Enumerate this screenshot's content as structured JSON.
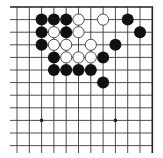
{
  "board": {
    "view": "top-right corner",
    "columns": 12,
    "rows": 12,
    "origin_x": 17,
    "origin_y": 7,
    "col_spacing": 12.3,
    "row_spacing": 12.6,
    "line_extend_left": 10,
    "line_extend_bottom": 153,
    "colors": {
      "line": "#3a3a3a",
      "border": "#222222",
      "black_stone": "#111111",
      "white_stone": "#ffffff",
      "white_stroke": "#222222",
      "background": "#ffffff"
    },
    "star_points": [
      {
        "col": 2,
        "row": 9
      },
      {
        "col": 8,
        "row": 9
      }
    ],
    "stones": [
      {
        "col": 2,
        "row": 1,
        "color": "black"
      },
      {
        "col": 3,
        "row": 1,
        "color": "black"
      },
      {
        "col": 4,
        "row": 1,
        "color": "black"
      },
      {
        "col": 5,
        "row": 1,
        "color": "white"
      },
      {
        "col": 7,
        "row": 1,
        "color": "white"
      },
      {
        "col": 9,
        "row": 1,
        "color": "black"
      },
      {
        "col": 2,
        "row": 2,
        "color": "black"
      },
      {
        "col": 3,
        "row": 2,
        "color": "white"
      },
      {
        "col": 4,
        "row": 2,
        "color": "black"
      },
      {
        "col": 5,
        "row": 2,
        "color": "white"
      },
      {
        "col": 10,
        "row": 2,
        "color": "black"
      },
      {
        "col": 2,
        "row": 3,
        "color": "black"
      },
      {
        "col": 3,
        "row": 3,
        "color": "white"
      },
      {
        "col": 4,
        "row": 3,
        "color": "white"
      },
      {
        "col": 6,
        "row": 3,
        "color": "white"
      },
      {
        "col": 8,
        "row": 3,
        "color": "black"
      },
      {
        "col": 3,
        "row": 4,
        "color": "black"
      },
      {
        "col": 4,
        "row": 4,
        "color": "white"
      },
      {
        "col": 5,
        "row": 4,
        "color": "white"
      },
      {
        "col": 6,
        "row": 4,
        "color": "white"
      },
      {
        "col": 7,
        "row": 4,
        "color": "black"
      },
      {
        "col": 3,
        "row": 5,
        "color": "black"
      },
      {
        "col": 4,
        "row": 5,
        "color": "black"
      },
      {
        "col": 5,
        "row": 5,
        "color": "black"
      },
      {
        "col": 6,
        "row": 5,
        "color": "black"
      },
      {
        "col": 7,
        "row": 6,
        "color": "black"
      }
    ]
  }
}
